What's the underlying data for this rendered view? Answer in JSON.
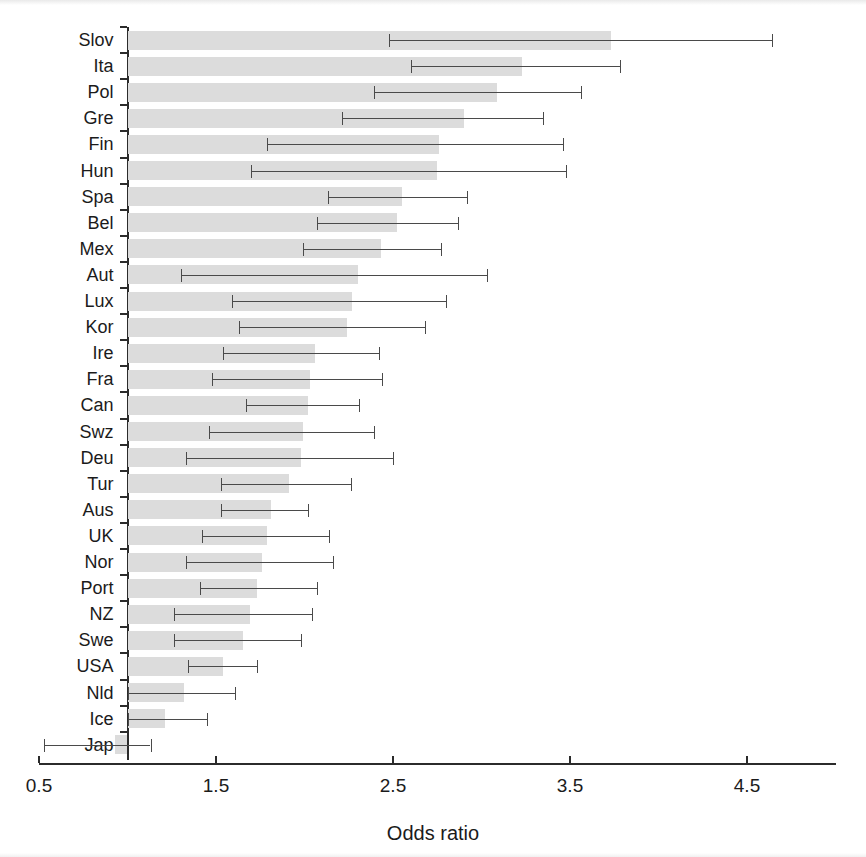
{
  "chart_data": {
    "type": "bar",
    "orientation": "horizontal",
    "title": "",
    "subtitle": "",
    "xlabel": "Odds ratio",
    "ylabel": "",
    "xlim": [
      0.5,
      5.0
    ],
    "xticks": [
      0.5,
      1.5,
      2.5,
      3.5,
      4.5
    ],
    "xtick_labels": [
      "0.5",
      "1.5",
      "2.5",
      "3.5",
      "4.5"
    ],
    "baseline": 1.0,
    "grid": false,
    "legend": null,
    "error_bars": "95% confidence interval",
    "bar_color": "#dcdcdc",
    "error_bar_color": "#4a4a4a",
    "axis_color": "#2b2b2b",
    "categories": [
      "Slov",
      "Ita",
      "Pol",
      "Gre",
      "Fin",
      "Hun",
      "Spa",
      "Bel",
      "Mex",
      "Aut",
      "Lux",
      "Kor",
      "Ire",
      "Fra",
      "Can",
      "Swz",
      "Deu",
      "Tur",
      "Aus",
      "UK",
      "Nor",
      "Port",
      "NZ",
      "Swe",
      "USA",
      "Nld",
      "Ice",
      "Jap"
    ],
    "values": [
      3.73,
      3.23,
      3.09,
      2.9,
      2.76,
      2.75,
      2.55,
      2.52,
      2.43,
      2.3,
      2.27,
      2.24,
      2.06,
      2.03,
      2.02,
      1.99,
      1.98,
      1.91,
      1.81,
      1.79,
      1.76,
      1.73,
      1.69,
      1.65,
      1.54,
      1.32,
      1.21,
      0.93
    ],
    "ci_low": [
      2.48,
      2.6,
      2.39,
      2.21,
      1.79,
      1.7,
      2.13,
      2.07,
      1.99,
      1.3,
      1.59,
      1.63,
      1.54,
      1.48,
      1.67,
      1.46,
      1.33,
      1.53,
      1.53,
      1.42,
      1.33,
      1.41,
      1.26,
      1.26,
      1.34,
      1.0,
      1.0,
      0.53
    ],
    "ci_high": [
      4.64,
      3.78,
      3.56,
      3.35,
      3.46,
      3.48,
      2.92,
      2.87,
      2.77,
      3.03,
      2.8,
      2.68,
      2.42,
      2.44,
      2.31,
      2.39,
      2.5,
      2.26,
      2.02,
      2.14,
      2.16,
      2.07,
      2.04,
      1.98,
      1.73,
      1.61,
      1.45,
      1.13
    ],
    "series": [
      {
        "name": "Odds ratio",
        "values": [
          3.73,
          3.23,
          3.09,
          2.9,
          2.76,
          2.75,
          2.55,
          2.52,
          2.43,
          2.3,
          2.27,
          2.24,
          2.06,
          2.03,
          2.02,
          1.99,
          1.98,
          1.91,
          1.81,
          1.79,
          1.76,
          1.73,
          1.69,
          1.65,
          1.54,
          1.32,
          1.21,
          0.93
        ]
      }
    ],
    "points": [
      {
        "category": "Slov",
        "value": 3.73,
        "ci_low": 2.48,
        "ci_high": 4.64
      },
      {
        "category": "Ita",
        "value": 3.23,
        "ci_low": 2.6,
        "ci_high": 3.78
      },
      {
        "category": "Pol",
        "value": 3.09,
        "ci_low": 2.39,
        "ci_high": 3.56
      },
      {
        "category": "Gre",
        "value": 2.9,
        "ci_low": 2.21,
        "ci_high": 3.35
      },
      {
        "category": "Fin",
        "value": 2.76,
        "ci_low": 1.79,
        "ci_high": 3.46
      },
      {
        "category": "Hun",
        "value": 2.75,
        "ci_low": 1.7,
        "ci_high": 3.48
      },
      {
        "category": "Spa",
        "value": 2.55,
        "ci_low": 2.13,
        "ci_high": 2.92
      },
      {
        "category": "Bel",
        "value": 2.52,
        "ci_low": 2.07,
        "ci_high": 2.87
      },
      {
        "category": "Mex",
        "value": 2.43,
        "ci_low": 1.99,
        "ci_high": 2.77
      },
      {
        "category": "Aut",
        "value": 2.3,
        "ci_low": 1.3,
        "ci_high": 3.03
      },
      {
        "category": "Lux",
        "value": 2.27,
        "ci_low": 1.59,
        "ci_high": 2.8
      },
      {
        "category": "Kor",
        "value": 2.24,
        "ci_low": 1.63,
        "ci_high": 2.68
      },
      {
        "category": "Ire",
        "value": 2.06,
        "ci_low": 1.54,
        "ci_high": 2.42
      },
      {
        "category": "Fra",
        "value": 2.03,
        "ci_low": 1.48,
        "ci_high": 2.44
      },
      {
        "category": "Can",
        "value": 2.02,
        "ci_low": 1.67,
        "ci_high": 2.31
      },
      {
        "category": "Swz",
        "value": 1.99,
        "ci_low": 1.46,
        "ci_high": 2.39
      },
      {
        "category": "Deu",
        "value": 1.98,
        "ci_low": 1.33,
        "ci_high": 2.5
      },
      {
        "category": "Tur",
        "value": 1.91,
        "ci_low": 1.53,
        "ci_high": 2.26
      },
      {
        "category": "Aus",
        "value": 1.81,
        "ci_low": 1.53,
        "ci_high": 2.02
      },
      {
        "category": "UK",
        "value": 1.79,
        "ci_low": 1.42,
        "ci_high": 2.14
      },
      {
        "category": "Nor",
        "value": 1.76,
        "ci_low": 1.33,
        "ci_high": 2.16
      },
      {
        "category": "Port",
        "value": 1.73,
        "ci_low": 1.41,
        "ci_high": 2.07
      },
      {
        "category": "NZ",
        "value": 1.69,
        "ci_low": 1.26,
        "ci_high": 2.04
      },
      {
        "category": "Swe",
        "value": 1.65,
        "ci_low": 1.26,
        "ci_high": 1.98
      },
      {
        "category": "USA",
        "value": 1.54,
        "ci_low": 1.34,
        "ci_high": 1.73
      },
      {
        "category": "Nld",
        "value": 1.32,
        "ci_low": 1.0,
        "ci_high": 1.61
      },
      {
        "category": "Ice",
        "value": 1.21,
        "ci_low": 1.0,
        "ci_high": 1.45
      },
      {
        "category": "Jap",
        "value": 0.93,
        "ci_low": 0.53,
        "ci_high": 1.13
      }
    ]
  },
  "axis": {
    "x_title": "Odds ratio",
    "x_tick_labels": [
      "0.5",
      "1.5",
      "2.5",
      "3.5",
      "4.5"
    ]
  }
}
